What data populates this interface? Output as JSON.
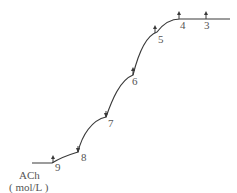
{
  "figure": {
    "type": "cumulative dose-response trace",
    "axis_label_line1": "ACh",
    "axis_label_line2": "( mol/L )",
    "markers": [
      {
        "label": "9",
        "x": 53,
        "y": 162
      },
      {
        "label": "8",
        "x": 78,
        "y": 152
      },
      {
        "label": "7",
        "x": 106,
        "y": 117
      },
      {
        "label": "6",
        "x": 133,
        "y": 75
      },
      {
        "label": "5",
        "x": 157,
        "y": 32
      },
      {
        "label": "4",
        "x": 180,
        "y": 19
      },
      {
        "label": "3",
        "x": 206,
        "y": 19
      }
    ],
    "colors": {
      "trace": "#3a3a3a",
      "text": "#555555",
      "background": "#ffffff"
    }
  }
}
